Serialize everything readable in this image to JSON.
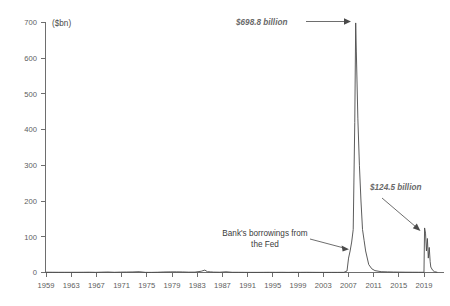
{
  "chart_data": {
    "type": "line",
    "title": "",
    "subtitle": "",
    "xlabel": "",
    "ylabel": "",
    "unit_label": "($bn)",
    "ylim": [
      0,
      700
    ],
    "xlim": [
      1959,
      2022
    ],
    "grid": false,
    "legend": "none",
    "y_ticks": [
      "0",
      "100",
      "200",
      "300",
      "400",
      "500",
      "600",
      "700"
    ],
    "y_tick_values": [
      0,
      100,
      200,
      300,
      400,
      500,
      600,
      700
    ],
    "x_ticks": [
      "1959",
      "1963",
      "1967",
      "1971",
      "1975",
      "1979",
      "1983",
      "1987",
      "1991",
      "1995",
      "1999",
      "2003",
      "2007",
      "2011",
      "2015",
      "2019"
    ],
    "x_tick_values": [
      1959,
      1963,
      1967,
      1971,
      1975,
      1979,
      1983,
      1987,
      1991,
      1995,
      1999,
      2003,
      2007,
      2011,
      2015,
      2019
    ],
    "series": [
      {
        "name": "Bank's borrowings from the Fed",
        "x": [
          1959,
          1960,
          1961,
          1962,
          1963,
          1964,
          1965,
          1966,
          1967,
          1968,
          1969,
          1970,
          1971,
          1972,
          1973,
          1974,
          1975,
          1976,
          1977,
          1978,
          1979,
          1980,
          1981,
          1982,
          1983,
          1984,
          1984.6,
          1985,
          1985.5,
          1986,
          1987,
          1988,
          1989,
          1990,
          1991,
          1992,
          1993,
          1994,
          1995,
          1996,
          1997,
          1998,
          1999,
          2000,
          2001,
          2002,
          2003,
          2004,
          2005,
          2006,
          2007,
          2007.5,
          2007.75,
          2008,
          2008.25,
          2008.5,
          2008.75,
          2008.9,
          2009,
          2009.25,
          2009.5,
          2009.75,
          2010,
          2010.25,
          2010.5,
          2011,
          2011.5,
          2012,
          2013,
          2014,
          2015,
          2016,
          2017,
          2018,
          2019,
          2019.9,
          2020,
          2020.15,
          2020.3,
          2020.45,
          2020.6,
          2020.75,
          2020.9,
          2021,
          2021.3,
          2021.6,
          2022
        ],
        "y": [
          0.5,
          0.4,
          0.3,
          0.3,
          0.3,
          0.3,
          0.4,
          0.6,
          0.2,
          0.7,
          1.1,
          0.3,
          0.8,
          1.0,
          1.3,
          2.0,
          0.2,
          0.1,
          0.5,
          1.2,
          1.5,
          1.6,
          1.3,
          0.7,
          0.8,
          3.2,
          6.5,
          2.0,
          1.5,
          0.8,
          0.5,
          1.7,
          0.3,
          0.3,
          0.2,
          0.1,
          0.1,
          0.2,
          0.3,
          0.2,
          0.3,
          0.1,
          0.3,
          0.2,
          0.3,
          0.2,
          0.1,
          0.1,
          0.1,
          0.1,
          0.2,
          4.0,
          40.0,
          60.0,
          85.0,
          120.0,
          420.0,
          698.8,
          620.0,
          430.0,
          300.0,
          200.0,
          120.0,
          90.0,
          60.0,
          22.0,
          10.0,
          5.0,
          2.0,
          1.5,
          1.0,
          0.8,
          0.6,
          0.5,
          0.4,
          0.3,
          124.5,
          110.0,
          60.0,
          95.0,
          40.0,
          70.0,
          30.0,
          15.0,
          6.0,
          2.0,
          0.5
        ]
      }
    ],
    "annotations": [
      {
        "id": "peak-2008",
        "text": "$698.8 billion",
        "style": "italic",
        "value": 698.8,
        "year": 2008.9
      },
      {
        "id": "peak-2020",
        "text": "$124.5 billion",
        "style": "italic",
        "value": 124.5,
        "year": 2020.0
      },
      {
        "id": "series-label",
        "text_line1": "Bank's borrowings from",
        "text_line2": "the Fed",
        "style": "plain"
      }
    ]
  }
}
